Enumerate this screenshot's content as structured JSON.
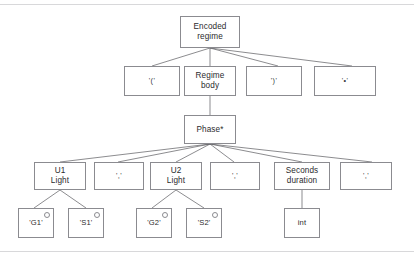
{
  "diagram": {
    "type": "syntax-tree",
    "nodes": {
      "root": {
        "label": "Encoded\nregime"
      },
      "row2": [
        {
          "id": "open-paren",
          "label": "'('"
        },
        {
          "id": "regime-body",
          "label": "Regime\nbody"
        },
        {
          "id": "close-paren",
          "label": "')'"
        },
        {
          "id": "terminator",
          "label": "'•'"
        }
      ],
      "phase": {
        "label": "Phase*"
      },
      "row4": [
        {
          "id": "u1-light",
          "label": "U1\nLight"
        },
        {
          "id": "sep-1",
          "label": "','"
        },
        {
          "id": "u2-light",
          "label": "U2\nLight"
        },
        {
          "id": "sep-2",
          "label": "','"
        },
        {
          "id": "seconds-duration",
          "label": "Seconds\nduration"
        },
        {
          "id": "sep-3",
          "label": "','"
        }
      ],
      "row5": [
        {
          "id": "g1",
          "label": "'G1'",
          "marker": "circle"
        },
        {
          "id": "s1",
          "label": "'S1'",
          "marker": "circle"
        },
        {
          "id": "g2",
          "label": "'G2'",
          "marker": "circle"
        },
        {
          "id": "s2",
          "label": "'S2'",
          "marker": "circle"
        },
        {
          "id": "int",
          "label": "int",
          "marker": "none"
        }
      ]
    },
    "colors": {
      "node_border": "#8b8b90",
      "edge": "#5a5a5f",
      "text": "#2b2b2e",
      "background": "#ffffff",
      "rule": "#d8d8da"
    }
  }
}
